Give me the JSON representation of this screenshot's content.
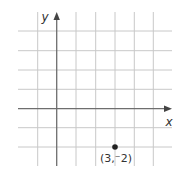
{
  "diagram": {
    "type": "coordinate-plane",
    "axes": {
      "x_label": "x",
      "y_label": "y"
    },
    "grid": {
      "x_min": -2,
      "x_max": 6,
      "y_min": -3,
      "y_max": 5
    },
    "point": {
      "x": 3,
      "y": -2,
      "label": "(3,⁻2)"
    },
    "colors": {
      "grid": "#c8c8c8",
      "axis": "#6e6e6e",
      "point": "#222222",
      "text": "#333333"
    }
  }
}
